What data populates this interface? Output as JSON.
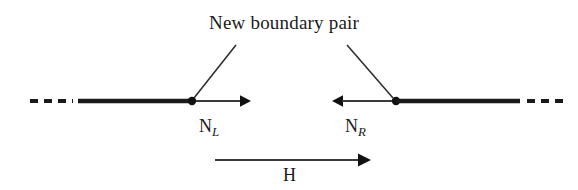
{
  "figure": {
    "title_caption": "New boundary pair",
    "labels": {
      "left_normal_base": "N",
      "left_normal_sub": "L",
      "right_normal_base": "N",
      "right_normal_sub": "R",
      "field": "H"
    },
    "colors": {
      "ink": "#1a1a1a",
      "thin_line": "#3a3a3a",
      "background": "#ffffff"
    },
    "geometry": {
      "width": 578,
      "height": 190,
      "domain_axis_y": 101,
      "left_dashes_x": [
        30,
        72
      ],
      "left_thick_segment_x": [
        78,
        192
      ],
      "left_boundary_dot_x": 192,
      "left_arrow_x": [
        194,
        250
      ],
      "right_arrow_x": [
        332,
        394
      ],
      "right_boundary_dot_x": 396,
      "right_thick_segment_x": [
        396,
        519
      ],
      "right_dashes_x": [
        527,
        566
      ],
      "field_arrow_x": [
        215,
        370
      ],
      "field_arrow_y": 160,
      "leader_left": [
        [
          235,
          45
        ],
        [
          193,
          99
        ]
      ],
      "leader_right": [
        [
          348,
          45
        ],
        [
          394,
          99
        ]
      ]
    }
  }
}
